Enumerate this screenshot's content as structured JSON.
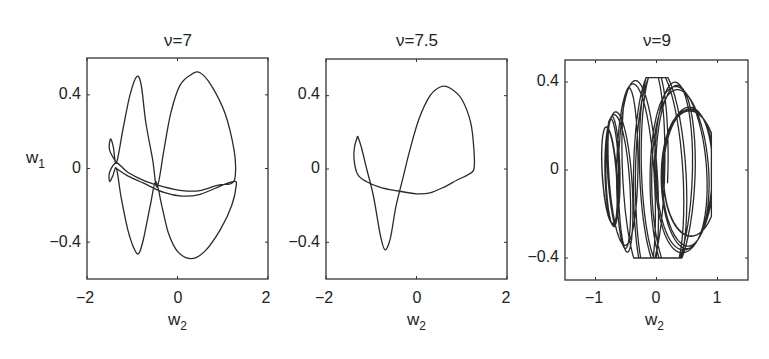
{
  "chart_data": [
    {
      "type": "line",
      "title": "ν=7",
      "xlabel": "w2",
      "ylabel": "w1",
      "xlim": [
        -2,
        2
      ],
      "ylim": [
        -0.6,
        0.6
      ],
      "xticks": [
        "-2",
        "0",
        "2"
      ],
      "yticks": [
        "0.4",
        "0",
        "-0.4"
      ],
      "grid": false,
      "legend": null,
      "description": "Phase portrait: closed periodic orbit with two large lobes (left peak ~(-0.85,0.5), right lobe peak ~(0.5,0.52)), lower lobes (~(-0.85,-0.46), (0.3,-0.49)) and small loops near w2≈-1.5; doubled band near w1≈-0.1",
      "series": [
        {
          "name": "trajectory",
          "points": [
            [
              -1.35,
              0.03
            ],
            [
              -1.5,
              0.1
            ],
            [
              -1.48,
              0.16
            ],
            [
              -1.42,
              0.12
            ],
            [
              -1.35,
              0.03
            ],
            [
              -1.2,
              0.22
            ],
            [
              -1.05,
              0.4
            ],
            [
              -0.9,
              0.5
            ],
            [
              -0.8,
              0.45
            ],
            [
              -0.7,
              0.25
            ],
            [
              -0.55,
              0.05
            ],
            [
              -0.45,
              -0.1
            ],
            [
              -0.3,
              0.1
            ],
            [
              -0.15,
              0.3
            ],
            [
              0.05,
              0.45
            ],
            [
              0.3,
              0.51
            ],
            [
              0.5,
              0.52
            ],
            [
              0.75,
              0.45
            ],
            [
              1.05,
              0.3
            ],
            [
              1.25,
              0.1
            ],
            [
              1.28,
              -0.03
            ],
            [
              1.2,
              -0.08
            ],
            [
              0.9,
              -0.09
            ],
            [
              0.5,
              -0.12
            ],
            [
              0.1,
              -0.12
            ],
            [
              -0.3,
              -0.1
            ],
            [
              -0.7,
              -0.07
            ],
            [
              -1.1,
              -0.02
            ],
            [
              -1.35,
              0.03
            ],
            [
              -1.5,
              -0.02
            ],
            [
              -1.5,
              -0.07
            ],
            [
              -1.43,
              -0.04
            ],
            [
              -1.35,
              0.0
            ],
            [
              -1.25,
              -0.15
            ],
            [
              -1.1,
              -0.33
            ],
            [
              -0.95,
              -0.44
            ],
            [
              -0.85,
              -0.46
            ],
            [
              -0.75,
              -0.38
            ],
            [
              -0.6,
              -0.2
            ],
            [
              -0.48,
              -0.07
            ],
            [
              -0.35,
              -0.2
            ],
            [
              -0.2,
              -0.35
            ],
            [
              0.0,
              -0.45
            ],
            [
              0.3,
              -0.49
            ],
            [
              0.6,
              -0.45
            ],
            [
              0.95,
              -0.33
            ],
            [
              1.2,
              -0.2
            ],
            [
              1.3,
              -0.09
            ],
            [
              1.25,
              -0.07
            ],
            [
              1.0,
              -0.09
            ],
            [
              0.5,
              -0.14
            ],
            [
              0.1,
              -0.15
            ],
            [
              -0.3,
              -0.13
            ],
            [
              -0.75,
              -0.08
            ],
            [
              -1.1,
              -0.04
            ],
            [
              -1.35,
              0.0
            ]
          ]
        }
      ]
    },
    {
      "type": "line",
      "title": "ν=7.5",
      "xlabel": "w2",
      "ylabel": "",
      "xlim": [
        -2,
        2
      ],
      "ylim": [
        -0.6,
        0.6
      ],
      "xticks": [
        "-2",
        "0",
        "2"
      ],
      "yticks": [
        "0.4",
        "0",
        "-0.4"
      ],
      "grid": false,
      "legend": null,
      "description": "Phase portrait: single figure-eight closed orbit; upper lobe peak ~(0.55,0.45), lower dip ~(-0.7,-0.44), small loop at ~(-1.3,0.18)",
      "series": [
        {
          "name": "trajectory",
          "points": [
            [
              -1.3,
              0.18
            ],
            [
              -1.37,
              0.12
            ],
            [
              -1.38,
              0.05
            ],
            [
              -1.3,
              -0.03
            ],
            [
              -1.1,
              -0.07
            ],
            [
              -0.8,
              -0.1
            ],
            [
              -0.4,
              -0.12
            ],
            [
              0.0,
              -0.135
            ],
            [
              0.3,
              -0.13
            ],
            [
              0.6,
              -0.1
            ],
            [
              0.9,
              -0.06
            ],
            [
              1.15,
              -0.03
            ],
            [
              1.27,
              0.0
            ],
            [
              1.27,
              0.1
            ],
            [
              1.2,
              0.25
            ],
            [
              1.0,
              0.38
            ],
            [
              0.75,
              0.44
            ],
            [
              0.55,
              0.45
            ],
            [
              0.3,
              0.4
            ],
            [
              0.05,
              0.27
            ],
            [
              -0.15,
              0.1
            ],
            [
              -0.3,
              -0.05
            ],
            [
              -0.45,
              -0.2
            ],
            [
              -0.58,
              -0.38
            ],
            [
              -0.7,
              -0.44
            ],
            [
              -0.8,
              -0.36
            ],
            [
              -0.95,
              -0.15
            ],
            [
              -1.1,
              0.0
            ],
            [
              -1.22,
              0.12
            ],
            [
              -1.3,
              0.18
            ]
          ]
        }
      ]
    },
    {
      "type": "line",
      "title": "ν=9",
      "xlabel": "w2",
      "ylabel": "",
      "xlim": [
        -1.5,
        1.5
      ],
      "ylim": [
        -0.5,
        0.5
      ],
      "xticks": [
        "-1",
        "0",
        "1"
      ],
      "yticks": [
        "0.4",
        "0",
        "-0.4"
      ],
      "grid": false,
      "legend": null,
      "description": "Phase portrait: quasi-periodic / chaotic trajectory filling a region w2∈[-0.9,0.9], w1∈[-0.4,0.42] with many nested elliptical loops and crossing bands near w1≈-0.1",
      "series": [
        {
          "name": "trajectory",
          "generator": "quasi-periodic",
          "x_range": [
            -0.9,
            0.9
          ],
          "y_range": [
            -0.4,
            0.42
          ]
        }
      ]
    }
  ],
  "figure": {
    "panels": [
      {
        "title": "ν=7",
        "xlabel": "w",
        "xlabel_sub": "2",
        "ylabel": "w",
        "ylabel_sub": "1"
      },
      {
        "title": "ν=7.5",
        "xlabel": "w",
        "xlabel_sub": "2"
      },
      {
        "title": "ν=9",
        "xlabel": "w",
        "xlabel_sub": "2"
      }
    ],
    "line_color": "#2a2a2a",
    "axes_color": "#333333"
  }
}
